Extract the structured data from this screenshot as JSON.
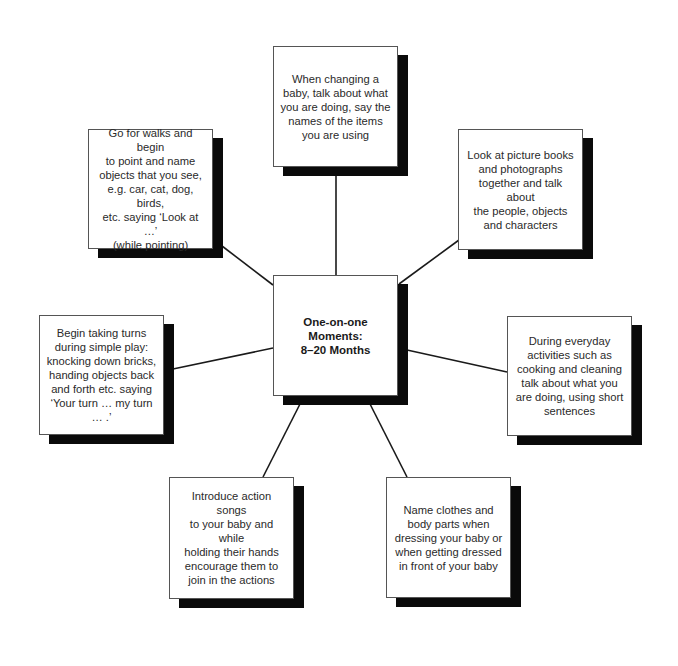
{
  "diagram": {
    "type": "spider-diagram",
    "center": {
      "label": "One-on-one\nMoments:\n8–20 Months"
    },
    "nodes": [
      {
        "id": "top",
        "text": "When changing a\nbaby, talk about what\nyou are doing, say the\nnames of the items\nyou are using"
      },
      {
        "id": "top-left",
        "text": "Go for walks and begin\nto point and name\nobjects that you see,\ne.g. car, cat, dog, birds,\netc. saying ‘Look at …’\n(while pointing)"
      },
      {
        "id": "top-right",
        "text": "Look at picture books\nand photographs\ntogether and talk about\nthe people, objects\nand characters"
      },
      {
        "id": "left",
        "text": "Begin taking turns\nduring simple play:\nknocking down bricks,\nhanding objects back\nand forth etc. saying\n‘Your turn … my turn … .’"
      },
      {
        "id": "right",
        "text": "During everyday\nactivities such as\ncooking and cleaning\ntalk about what you\nare doing, using short\nsentences"
      },
      {
        "id": "bottom-left",
        "text": "Introduce action songs\nto your baby and while\nholding their hands\nencourage them to\njoin in the actions"
      },
      {
        "id": "bottom-right",
        "text": "Name clothes and\nbody parts when\ndressing your baby or\nwhen getting dressed\nin front of your baby"
      }
    ],
    "colors": {
      "shadow": "#0a0a0a",
      "border": "#555555",
      "line": "#1a1a1a",
      "background": "#ffffff"
    }
  }
}
